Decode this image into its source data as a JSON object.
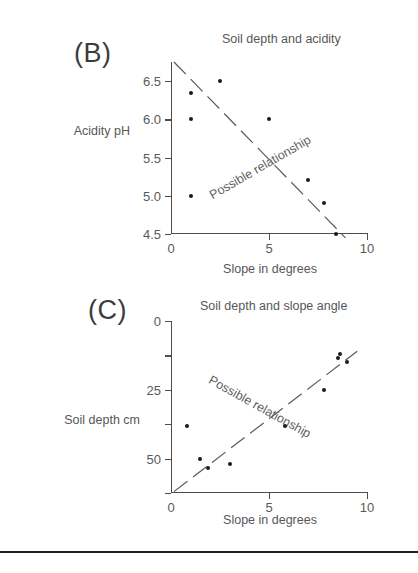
{
  "figure": {
    "bottom_rule": true
  },
  "panels": [
    {
      "key": "B",
      "letter": "(B)",
      "title": "Soil depth and acidity",
      "trend_label": "Possible relationship"
    },
    {
      "key": "C",
      "letter": "(C)",
      "title": "Soil depth and slope angle",
      "trend_label": "Possible relationship"
    }
  ],
  "chart_data": [
    {
      "type": "scatter",
      "panel": "B",
      "title": "Soil depth and acidity",
      "xlabel": "Slope in degrees",
      "ylabel": "Acidity pH",
      "xlim": [
        0,
        10
      ],
      "ylim": [
        6.75,
        4.5
      ],
      "y_inverted": true,
      "xticks": [
        0,
        5,
        10
      ],
      "xtick_labels": [
        "0",
        "5",
        "10"
      ],
      "yticks": [
        4.5,
        5.0,
        5.5,
        6.0,
        6.5
      ],
      "ytick_labels": [
        "4.5",
        "5.0",
        "5.5",
        "6.0",
        "6.5"
      ],
      "grid": false,
      "legend": "none",
      "annotation": "Possible relationship",
      "trendline": {
        "x": [
          0.15,
          8.9
        ],
        "y": [
          6.75,
          4.45
        ]
      },
      "points": [
        {
          "x": 1.0,
          "y": 5.0
        },
        {
          "x": 1.0,
          "y": 6.0
        },
        {
          "x": 1.0,
          "y": 6.35
        },
        {
          "x": 2.5,
          "y": 6.5
        },
        {
          "x": 5.0,
          "y": 6.0
        },
        {
          "x": 7.0,
          "y": 5.2
        },
        {
          "x": 7.8,
          "y": 4.9
        },
        {
          "x": 8.4,
          "y": 4.5
        }
      ]
    },
    {
      "type": "scatter",
      "panel": "C",
      "title": "Soil depth and slope angle",
      "xlabel": "Slope in degrees",
      "ylabel": "Soil depth cm",
      "xlim": [
        0,
        10
      ],
      "ylim": [
        0,
        62.5
      ],
      "y_inverted": false,
      "xticks": [
        0,
        5,
        10
      ],
      "xtick_labels": [
        "0",
        "5",
        "10"
      ],
      "yticks": [
        0,
        12.5,
        25,
        37.5,
        50,
        62.5
      ],
      "ytick_labels": [
        "0",
        "",
        "25",
        "",
        "50",
        ""
      ],
      "grid": false,
      "legend": "none",
      "annotation": "Possible relationship",
      "trendline": {
        "x": [
          0.15,
          9.5
        ],
        "y": [
          62.0,
          11.0
        ]
      },
      "points": [
        {
          "x": 0.8,
          "y": 38.0
        },
        {
          "x": 1.5,
          "y": 50.0
        },
        {
          "x": 1.9,
          "y": 53.5
        },
        {
          "x": 3.0,
          "y": 52.0
        },
        {
          "x": 5.8,
          "y": 38.0
        },
        {
          "x": 7.8,
          "y": 25.0
        },
        {
          "x": 8.5,
          "y": 13.5
        },
        {
          "x": 8.6,
          "y": 12.0
        },
        {
          "x": 9.0,
          "y": 15.0
        }
      ]
    }
  ]
}
